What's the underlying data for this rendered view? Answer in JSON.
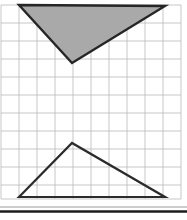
{
  "figure": {
    "canvas": {
      "width": 187,
      "height": 220
    },
    "background_color": "#ffffff",
    "grid": {
      "name": "square-grid",
      "line_color": "#b9b9b9",
      "line_width": 0.8,
      "cell_size": 18,
      "origin_x": 1,
      "origin_y": 5,
      "columns": 10,
      "rows": 11,
      "x_lines": [
        1,
        19,
        37,
        55,
        73,
        91,
        109,
        127,
        145,
        163,
        181
      ],
      "y_lines": [
        5,
        23,
        41,
        59,
        77,
        95,
        113,
        131,
        149,
        167,
        185,
        199
      ]
    },
    "shapes": [
      {
        "name": "shaded-triangle-top",
        "orientation": "pointing-down",
        "points": "19,5 165,6 72,63",
        "vertices": [
          {
            "label": "top-left",
            "x": 19,
            "y": 5
          },
          {
            "label": "top-right",
            "x": 165,
            "y": 6
          },
          {
            "label": "bottom-apex",
            "x": 72,
            "y": 63
          }
        ],
        "fill": "#a9a9a9",
        "stroke": "#262626",
        "stroke_width": 2.4
      },
      {
        "name": "outline-triangle-bottom",
        "orientation": "pointing-up",
        "points": "19,197 72,143 165,197",
        "vertices": [
          {
            "label": "bottom-left",
            "x": 19,
            "y": 197
          },
          {
            "label": "top-apex",
            "x": 72,
            "y": 143
          },
          {
            "label": "bottom-right",
            "x": 165,
            "y": 197
          }
        ],
        "fill": "none",
        "stroke": "#2b2b2b",
        "stroke_width": 2.2
      }
    ],
    "rules": [
      {
        "name": "thin-rule",
        "x1": 0,
        "y1": 207,
        "x2": 187,
        "y2": 207,
        "color": "#8e8e8e",
        "width": 0.9
      },
      {
        "name": "thick-rule",
        "x1": 0,
        "y1": 211.5,
        "x2": 187,
        "y2": 211.5,
        "color": "#1c1c1c",
        "width": 2.6
      }
    ]
  }
}
